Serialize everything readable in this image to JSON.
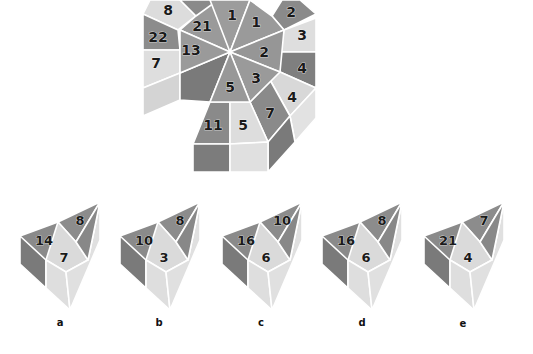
{
  "colors": {
    "dark": "#7e7e7e",
    "mid": "#999999",
    "light": "#d6d6d6",
    "lighter": "#e4e4e4",
    "darkest": "#6a6a6a",
    "background": "#ffffff"
  },
  "main_figure": {
    "description": "Octagonal prism with wedge-shaped numbered faces, one wedge removed",
    "center_wedges": [
      {
        "id": "top-left",
        "value": "21"
      },
      {
        "id": "top",
        "value": "1"
      },
      {
        "id": "top-right",
        "value": "1"
      },
      {
        "id": "right",
        "value": "2"
      },
      {
        "id": "bottom-right",
        "value": "3"
      },
      {
        "id": "bottom",
        "value": "5"
      },
      {
        "id": "left",
        "value": "13"
      }
    ],
    "outer_faces": [
      {
        "id": "outer-top-left",
        "value": "8"
      },
      {
        "id": "outer-left-upper",
        "value": "22"
      },
      {
        "id": "outer-left",
        "value": "7"
      },
      {
        "id": "outer-top-right",
        "value": "2"
      },
      {
        "id": "outer-right-upper",
        "value": "3"
      },
      {
        "id": "outer-right",
        "value": "4"
      },
      {
        "id": "outer-right-lower",
        "value": "4"
      },
      {
        "id": "outer-bottom-right",
        "value": "7"
      },
      {
        "id": "outer-bottom-left",
        "value": "11"
      },
      {
        "id": "outer-bottom-center",
        "value": "5"
      }
    ]
  },
  "options": [
    {
      "label": "a",
      "left": "14",
      "right": "8",
      "front": "7"
    },
    {
      "label": "b",
      "left": "10",
      "right": "8",
      "front": "3"
    },
    {
      "label": "c",
      "left": "16",
      "right": "10",
      "front": "6"
    },
    {
      "label": "d",
      "left": "16",
      "right": "8",
      "front": "6"
    },
    {
      "label": "e",
      "left": "21",
      "right": "7",
      "front": "4"
    }
  ]
}
